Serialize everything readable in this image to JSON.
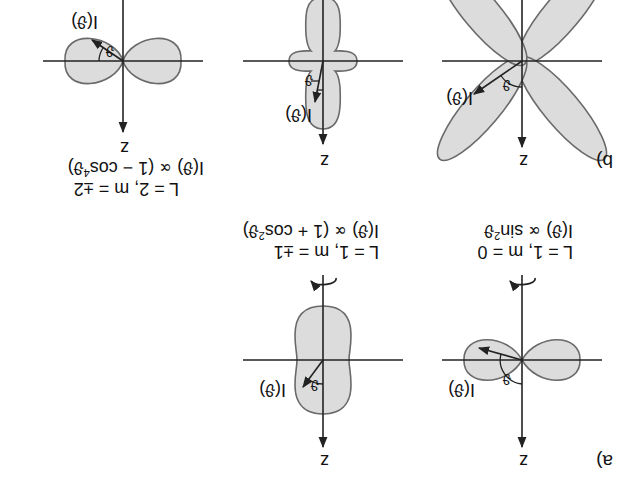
{
  "figure": {
    "orientation": "rotated-180",
    "panel_a": {
      "letter": "a)",
      "diagrams": [
        {
          "id": "a1",
          "axis_label": "z",
          "intensity_label": "I(ϑ)",
          "angle_label": "ϑ",
          "quantum_numbers": "L = 1, m = 0",
          "formula_prefix": "I(ϑ) ∝ sin",
          "formula_exp": "2",
          "formula_suffix": "ϑ",
          "shape": "two horizontal lobes (dipole, sin²ϑ)"
        },
        {
          "id": "a2",
          "axis_label": "z",
          "intensity_label": "I(ϑ)",
          "angle_label": "ϑ",
          "quantum_numbers": "L = 1, m = ±1",
          "formula_prefix": "I(ϑ) ∝ (1 + cos",
          "formula_exp": "2",
          "formula_suffix": "ϑ)",
          "shape": "peanut elongated along z (1+cos²ϑ)"
        }
      ]
    },
    "panel_b": {
      "letter": "b)",
      "diagrams": [
        {
          "id": "b1",
          "axis_label": "z",
          "intensity_label": "I(ϑ)",
          "angle_label": "ϑ",
          "shape": "four-leaf clover lobes at 45°"
        },
        {
          "id": "b2",
          "axis_label": "z",
          "intensity_label": "I(ϑ)",
          "angle_label": "ϑ",
          "shape": "long lobes along z with small side lobes"
        },
        {
          "id": "b3",
          "axis_label": "z",
          "intensity_label": "I(ϑ)",
          "angle_label": "ϑ",
          "quantum_numbers": "L = 2, m = ±2",
          "formula_prefix": "I(ϑ) ∝ (1 − cos",
          "formula_exp": "4",
          "formula_suffix": "ϑ)",
          "shape": "two horizontal lobes (1−cos⁴ϑ)"
        }
      ]
    },
    "colors": {
      "lobe_fill": "#dcdcdc",
      "lobe_stroke": "#6a6a6a",
      "axis": "#222222",
      "text": "#111111"
    }
  }
}
